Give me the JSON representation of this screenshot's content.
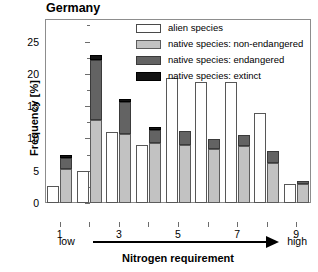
{
  "chart_data": {
    "type": "bar",
    "title": "Germany",
    "xlabel": "Nitrogen requirement",
    "ylabel": "Frequency [%]",
    "grid": false,
    "legend_position": "top-right",
    "categories": [
      "1",
      "2",
      "3",
      "4",
      "5",
      "6",
      "7",
      "8",
      "9"
    ],
    "xtick_labels": [
      "1",
      "",
      "3",
      "",
      "5",
      "",
      "7",
      "",
      "9"
    ],
    "xlim": [
      0.5,
      9.5
    ],
    "ylim": [
      0,
      28.5
    ],
    "ytick_values": [
      0,
      5,
      10,
      15,
      20,
      25
    ],
    "ytick_labels": [
      "0",
      "5",
      "10",
      "15",
      "20",
      "25"
    ],
    "yminor_values": [
      2.5,
      7.5,
      12.5,
      17.5,
      22.5,
      27.5
    ],
    "axis_annotation": {
      "left_label": "low",
      "right_label": "high",
      "arrow": "left-to-right"
    },
    "series": [
      {
        "name": "alien species",
        "key": "alien",
        "color": "#ffffff",
        "edge_color": "#575757",
        "stacked": false,
        "values": [
          2.7,
          4.9,
          11.0,
          9.0,
          19.3,
          18.7,
          18.7,
          14.0,
          2.9
        ]
      },
      {
        "name": "native species: non-endangered",
        "key": "nonendangered",
        "color": "#c2c2c2",
        "edge_color": "#5c5c5c",
        "stacked": true,
        "values": [
          5.2,
          12.8,
          10.7,
          9.3,
          9.0,
          8.3,
          8.8,
          6.2,
          3.0
        ]
      },
      {
        "name": "native species: endangered",
        "key": "endangered",
        "color": "#636363",
        "edge_color": "#3a3a3a",
        "stacked": true,
        "values": [
          1.8,
          9.3,
          5.0,
          2.0,
          2.2,
          1.6,
          1.8,
          1.8,
          0.4
        ]
      },
      {
        "name": "native species: extinct",
        "key": "extinct",
        "color": "#141414",
        "edge_color": "#000000",
        "stacked": true,
        "values": [
          0.4,
          0.9,
          0.4,
          0.5,
          0.0,
          0.0,
          0.0,
          0.0,
          0.0
        ]
      }
    ],
    "native_totals": [
      7.4,
      23.0,
      16.1,
      11.8,
      11.2,
      9.9,
      10.6,
      8.0,
      3.4
    ]
  },
  "legend": {
    "items": [
      {
        "label": "alien species",
        "swatch": "sw-alien"
      },
      {
        "label": "native species: non-endangered",
        "swatch": "sw-nonendangered"
      },
      {
        "label": "native species: endangered",
        "swatch": "sw-endangered"
      },
      {
        "label": "native species: extinct",
        "swatch": "sw-extinct"
      }
    ]
  }
}
